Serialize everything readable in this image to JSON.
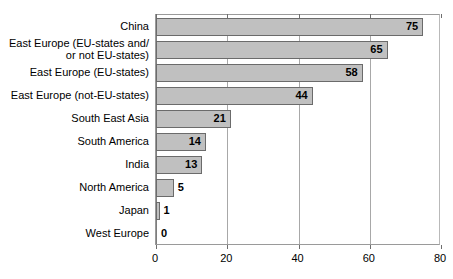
{
  "chart_data": {
    "type": "bar",
    "orientation": "horizontal",
    "title": "",
    "xlabel": "",
    "ylabel": "",
    "xlim": [
      0,
      80
    ],
    "xticks": [
      0,
      20,
      40,
      60,
      80
    ],
    "grid": true,
    "legend": false,
    "bar_fill_color": "#c0c0c0",
    "bar_border_color": "#6b6b6b",
    "categories": [
      "China",
      "East Europe (EU-states and/\nor not EU-states)",
      "East Europe (EU-states)",
      "East Europe (not-EU-states)",
      "South East Asia",
      "South America",
      "India",
      "North America",
      "Japan",
      "West Europe"
    ],
    "values": [
      75,
      65,
      58,
      44,
      21,
      14,
      13,
      5,
      1,
      0
    ],
    "data_labels": [
      "75",
      "65",
      "58",
      "44",
      "21",
      "14",
      "13",
      "5",
      "1",
      "0"
    ],
    "tick_labels": [
      "0",
      "20",
      "40",
      "60",
      "80"
    ]
  }
}
